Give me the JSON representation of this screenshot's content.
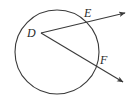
{
  "diagram": {
    "type": "geometry",
    "colors": {
      "stroke": "#3a3a3a",
      "label": "#2a2a2a",
      "background": "#ffffff"
    },
    "circle": {
      "cx": 57,
      "cy": 52,
      "r": 42
    },
    "points": [
      {
        "name": "D",
        "x": 41,
        "y": 33,
        "label": "D",
        "label_x": 27,
        "label_y": 37
      },
      {
        "name": "E",
        "x": 86,
        "y": 21,
        "label": "E",
        "label_x": 84,
        "label_y": 17
      },
      {
        "name": "F",
        "x": 96,
        "y": 67,
        "label": "F",
        "label_x": 100,
        "label_y": 64
      }
    ],
    "rays": [
      {
        "name": "ray-DE",
        "from": "D",
        "through": "E",
        "tip_x": 125,
        "tip_y": 13
      },
      {
        "name": "ray-DF",
        "from": "D",
        "through": "F",
        "tip_x": 123,
        "tip_y": 82
      }
    ],
    "labels": {
      "D": "D",
      "E": "E",
      "F": "F"
    }
  }
}
